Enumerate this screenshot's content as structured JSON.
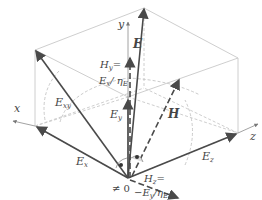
{
  "diagram": {
    "type": "3d-vector-diagram",
    "colors": {
      "vector": "#4a4a4a",
      "box": "#c8c8c8",
      "axis": "#9a9a9a",
      "text": "#444444"
    },
    "axes": {
      "x": {
        "label": "x"
      },
      "y": {
        "label": "y"
      },
      "z": {
        "label": "z"
      }
    },
    "vectors": {
      "E": {
        "label": "E"
      },
      "Exy": {
        "label": "E",
        "sub": "xy"
      },
      "Ex": {
        "label": "E",
        "sub": "x"
      },
      "Ey": {
        "label": "E",
        "sub": "y"
      },
      "Ez": {
        "label": "E",
        "sub": "z"
      },
      "H": {
        "label": "H"
      }
    },
    "annotations": {
      "Hy_line1": "H",
      "Hy_line1_sub": "y",
      "Hy_line1_eq": "=",
      "Hy_line2": "E",
      "Hy_line2_sub": "x",
      "Hy_line2_rest": "/ η",
      "Hy_line2_rest_sub": "E",
      "Hz_line1": "H",
      "Hz_line1_sub": "z",
      "Hz_line1_eq": "=",
      "Hz_line2": "−E",
      "Hz_line2_sub": "y",
      "Hz_line2_rest": "/η",
      "Hz_line2_rest_sub": "E",
      "neq_zero": "≠ 0"
    }
  }
}
